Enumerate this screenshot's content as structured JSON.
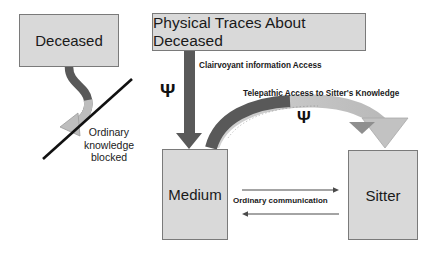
{
  "diagram": {
    "colors": {
      "box_fill": "#d9d9d9",
      "box_border": "#7a7a7a",
      "dark_arrow": "#595959",
      "light_arrow": "#bfbfbf",
      "line_black": "#111111",
      "background": "#ffffff"
    },
    "nodes": [
      {
        "id": "deceased",
        "label": "Deceased"
      },
      {
        "id": "physical_traces",
        "label": "Physical Traces About Deceased"
      },
      {
        "id": "medium",
        "label": "Medium"
      },
      {
        "id": "sitter",
        "label": "Sitter"
      }
    ],
    "edges": [
      {
        "id": "clairvoyant",
        "label": "Clairvoyant information Access",
        "from": "physical_traces",
        "to": "medium",
        "symbol": "Ψ",
        "style": "dark-straight-down-arrow"
      },
      {
        "id": "telepathic",
        "label": "Telepathic Access to Sitter's Knowledge",
        "from": "sitter",
        "to": "medium",
        "symbol": "Ψ",
        "style": "curved-arc-arrow"
      },
      {
        "id": "ordinary_communication",
        "label": "Ordinary communication",
        "from": "medium",
        "to": "sitter",
        "style": "bidirectional-thin-arrows"
      },
      {
        "id": "blocked",
        "label": "Ordinary\nknowledge\nblocked",
        "label_lines": [
          "Ordinary",
          "knowledge",
          "blocked"
        ],
        "from": "deceased",
        "to": "medium",
        "style": "curved-arrow-crossed-out"
      }
    ],
    "symbols": {
      "psi": "Ψ"
    },
    "blocked_label_line1": "Ordinary",
    "blocked_label_line2": "knowledge",
    "blocked_label_line3": "blocked"
  }
}
